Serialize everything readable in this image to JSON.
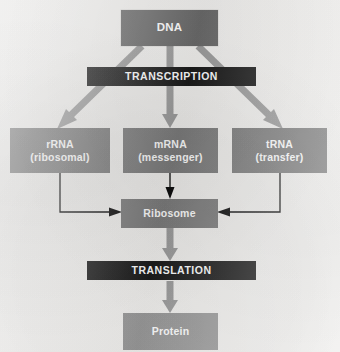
{
  "diagram": {
    "background_color": "#f3f2f0",
    "nodes": {
      "dna": {
        "label": "DNA",
        "fill": "#6b6b6b",
        "text_color": "#ffffff"
      },
      "transcription": {
        "label": "TRANSCRIPTION",
        "fill": "#1b1b1b",
        "text_color": "#ffffff"
      },
      "rrna": {
        "line1": "rRNA",
        "line2": "(ribosomal)",
        "fill": "#7e7e7e",
        "text_color": "#ffffff"
      },
      "mrna": {
        "line1": "mRNA",
        "line2": "(messenger)",
        "fill": "#7e7e7e",
        "text_color": "#ffffff"
      },
      "trna": {
        "line1": "tRNA",
        "line2": "(transfer)",
        "fill": "#7e7e7e",
        "text_color": "#ffffff"
      },
      "ribosome": {
        "label": "Ribosome",
        "fill": "#7e7e7e",
        "text_color": "#ffffff"
      },
      "translation": {
        "label": "TRANSLATION",
        "fill": "#1b1b1b",
        "text_color": "#ffffff"
      },
      "protein": {
        "label": "Protein",
        "fill": "#9a9a9a",
        "text_color": "#ffffff"
      }
    },
    "connectors": {
      "thick_arrow_color": "#9e9e9e",
      "thin_arrow_color": "#0d0d0d",
      "edges": [
        {
          "name": "dna-to-rrna",
          "from": "dna",
          "to": "rrna",
          "style": "thick-block-arrow",
          "direction": "diagonal-down-left"
        },
        {
          "name": "dna-to-mrna",
          "from": "dna",
          "to": "mrna",
          "style": "thick-block-arrow",
          "direction": "down"
        },
        {
          "name": "dna-to-trna",
          "from": "dna",
          "to": "trna",
          "style": "thick-block-arrow",
          "direction": "diagonal-down-right"
        },
        {
          "name": "rrna-to-ribosome",
          "from": "rrna",
          "to": "ribosome",
          "style": "thin-elbow-arrow",
          "direction": "down-then-right"
        },
        {
          "name": "mrna-to-ribosome",
          "from": "mrna",
          "to": "ribosome",
          "style": "thin-line-arrow",
          "direction": "down"
        },
        {
          "name": "trna-to-ribosome",
          "from": "trna",
          "to": "ribosome",
          "style": "thin-elbow-arrow",
          "direction": "down-then-left"
        },
        {
          "name": "ribosome-to-translation",
          "from": "ribosome",
          "to": "translation",
          "style": "thick-block-arrow",
          "direction": "down"
        },
        {
          "name": "translation-to-protein",
          "from": "translation",
          "to": "protein",
          "style": "thick-block-arrow",
          "direction": "down"
        }
      ]
    }
  }
}
